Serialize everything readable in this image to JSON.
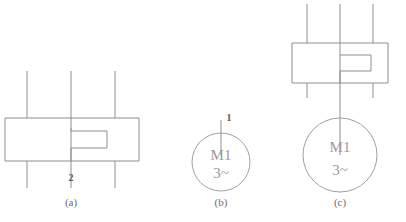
{
  "figure": {
    "background_color": "#ffffff",
    "line_color": "#8e8e8e",
    "text_color": "#6a6a6a",
    "width": 406,
    "height": 222
  },
  "panels": [
    {
      "id": "a",
      "caption": "(a)",
      "description": "three-phase switching device symbol, notched rectangle with three vertical conductor lines",
      "terminal_label": "2",
      "phase_count": 3
    },
    {
      "id": "b",
      "caption": "(b)",
      "description": "three-phase motor symbol",
      "terminal_label": "1",
      "motor_designation": "M1",
      "motor_type": "3~"
    },
    {
      "id": "c",
      "caption": "(c)",
      "description": "combined three-phase switching device connected to motor",
      "motor_designation": "M1",
      "motor_type": "3~",
      "phase_count": 3
    }
  ]
}
